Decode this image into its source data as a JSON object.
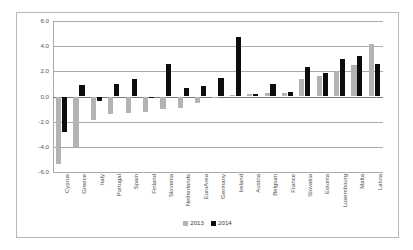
{
  "chart_data": {
    "type": "bar",
    "title": "",
    "subtitle": "",
    "xlabel": "",
    "ylabel": "",
    "ylim": [
      -6.0,
      6.0
    ],
    "yticks": [
      "6.0",
      "4.0",
      "2.0",
      "0.0",
      "-2.0",
      "-4.0",
      "-6.0"
    ],
    "ytick_values": [
      6.0,
      4.0,
      2.0,
      0.0,
      -2.0,
      -4.0,
      -6.0
    ],
    "grid": true,
    "legend_position": "bottom",
    "categories": [
      "Cyprus",
      "Greece",
      "Italy",
      "Portugal",
      "Spain",
      "Finland",
      "Slovenia",
      "Netherlands",
      "EuroArea",
      "Germany",
      "Ireland",
      "Austria",
      "Belgium",
      "France",
      "Slovakia",
      "Estonia",
      "Luxembourg",
      "Malta",
      "Latvia"
    ],
    "series": [
      {
        "name": "2013",
        "color": "#b3b3b3",
        "values": [
          -5.4,
          -4.0,
          -1.9,
          -1.4,
          -1.3,
          -1.2,
          -1.0,
          -0.9,
          -0.5,
          -0.05,
          0.1,
          0.2,
          0.25,
          0.25,
          1.4,
          1.6,
          2.0,
          2.5,
          4.2
        ]
      },
      {
        "name": "2014",
        "color": "#0d0d0d",
        "values": [
          -2.8,
          0.9,
          -0.35,
          1.0,
          1.4,
          -0.05,
          2.55,
          0.65,
          0.8,
          1.45,
          4.7,
          0.2,
          1.0,
          0.35,
          2.35,
          1.9,
          2.95,
          3.25,
          2.55
        ]
      }
    ]
  },
  "legend": {
    "items": [
      {
        "label": "2013",
        "color": "#b3b3b3"
      },
      {
        "label": "2014",
        "color": "#0d0d0d"
      }
    ]
  }
}
